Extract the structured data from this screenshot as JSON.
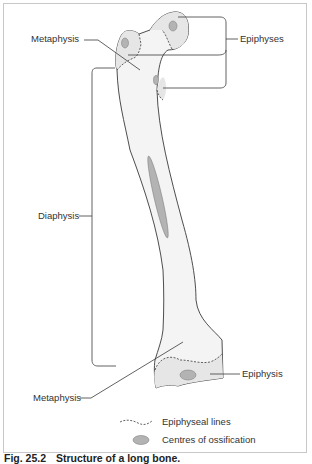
{
  "figure": {
    "caption_number": "Fig. 25.2",
    "caption_title": "Structure of a long bone.",
    "colors": {
      "bone_fill": "#ececec",
      "bone_outline": "#3a3a3a",
      "ossification_centre": "#b3b3b3",
      "frame": "#c8c8c8"
    }
  },
  "labels": {
    "metaphysis_top": "Metaphysis",
    "epiphyses": "Epiphyses",
    "diaphysis": "Diaphysis",
    "epiphysis_bottom": "Epiphysis",
    "metaphysis_bottom": "Metaphysis"
  },
  "legend": {
    "items": [
      {
        "symbol": "dashed-line",
        "label": "Epiphyseal lines"
      },
      {
        "symbol": "grey-ellipse",
        "label": "Centres of ossification"
      }
    ]
  }
}
